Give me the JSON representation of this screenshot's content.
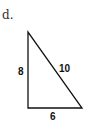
{
  "problem": {
    "label": "d."
  },
  "triangle": {
    "sides": {
      "left": "8",
      "hypotenuse": "10",
      "bottom": "6"
    },
    "stroke_color": "#111111"
  }
}
